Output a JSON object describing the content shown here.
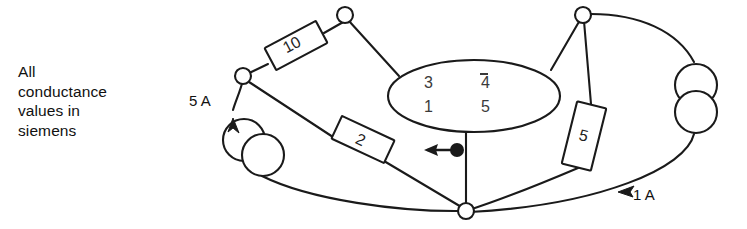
{
  "caption": {
    "lines": [
      "All",
      "conductance",
      "values in",
      "siemens"
    ]
  },
  "sources": [
    {
      "id": "source-5a",
      "label": "5 A",
      "symbol": "double-circle-current-source",
      "direction": "up"
    },
    {
      "id": "source-1a",
      "label": "1 A",
      "symbol": "double-circle-current-source",
      "direction": "down-left"
    }
  ],
  "components": [
    {
      "id": "conductance-10",
      "label": "10",
      "unit": "siemens",
      "rotation": -28
    },
    {
      "id": "conductance-2",
      "label": "2",
      "unit": "siemens",
      "rotation": 25
    },
    {
      "id": "conductance-5",
      "label": "5",
      "unit": "siemens",
      "rotation": 14
    }
  ],
  "matrix": {
    "name": "conductance-matrix",
    "rows": [
      {
        "c1": "3",
        "c2_sign": "⁻",
        "c2": "4"
      },
      {
        "c1": "1",
        "c2_sign": "",
        "c2": "5"
      }
    ]
  },
  "pointer": {
    "name": "arrow-pointer",
    "direction": "left",
    "marker": "filled-dot"
  },
  "nodes": [
    {
      "id": "node-top",
      "x": 345,
      "y": 15
    },
    {
      "id": "node-left",
      "x": 243,
      "y": 76
    },
    {
      "id": "node-top-right",
      "x": 583,
      "y": 15
    },
    {
      "id": "node-bottom",
      "x": 466,
      "y": 211
    }
  ],
  "colors": {
    "stroke": "#1a1a1a",
    "text": "#111111",
    "matrix_text": "#3a3a3a",
    "background": "#ffffff"
  }
}
